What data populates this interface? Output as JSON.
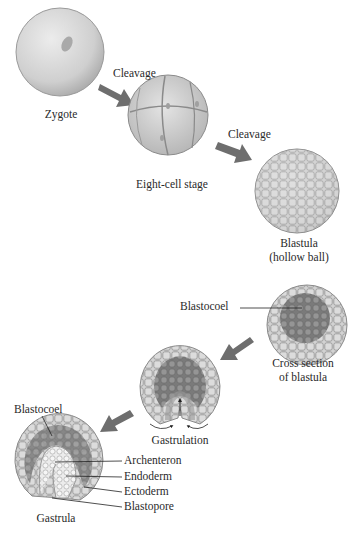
{
  "stages": {
    "zygote": "Zygote",
    "cleavage1": "Cleavage",
    "eight_cell": "Eight-cell stage",
    "cleavage2": "Cleavage",
    "blastula_line1": "Blastula",
    "blastula_line2": "(hollow ball)",
    "blastocoel1": "Blastocoel",
    "cross_section_line1": "Cross section",
    "cross_section_line2": "of blastula",
    "gastrulation": "Gastrulation",
    "blastocoel2": "Blastocoel",
    "archenteron": "Archenteron",
    "endoderm": "Endoderm",
    "ectoderm": "Ectoderm",
    "blastopore": "Blastopore",
    "gastrula": "Gastrula"
  },
  "colors": {
    "arrow": "#6e6e6e",
    "cell_fill": "#c9c9c9",
    "cell_outline": "#8a8a8a",
    "blastocoel_dark": "#7d7d7d",
    "endoderm_light": "#e6e6e6"
  }
}
